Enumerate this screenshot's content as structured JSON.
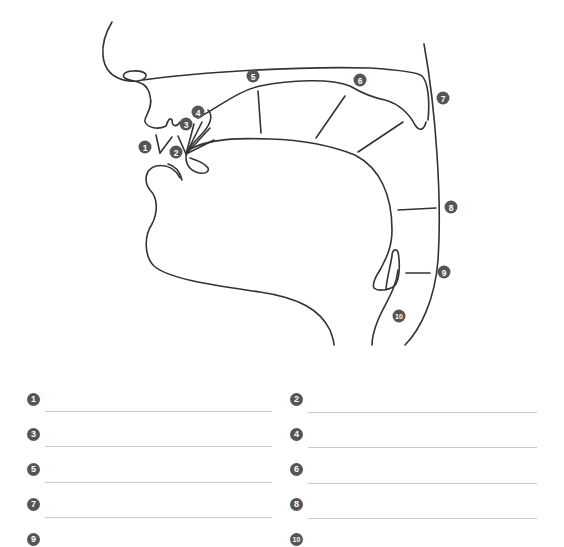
{
  "diagram": {
    "labels": [
      {
        "id": 1,
        "text": "1",
        "x": 145,
        "y": 147
      },
      {
        "id": 2,
        "text": "2",
        "x": 176,
        "y": 152
      },
      {
        "id": 3,
        "text": "3",
        "x": 186,
        "y": 124
      },
      {
        "id": 4,
        "text": "4",
        "x": 198,
        "y": 112
      },
      {
        "id": 5,
        "text": "5",
        "x": 253,
        "y": 76
      },
      {
        "id": 6,
        "text": "6",
        "x": 360,
        "y": 80
      },
      {
        "id": 7,
        "text": "7",
        "x": 443,
        "y": 98
      },
      {
        "id": 8,
        "text": "8",
        "x": 451,
        "y": 207
      },
      {
        "id": 9,
        "text": "9",
        "x": 444,
        "y": 272
      },
      {
        "id": 10,
        "text": "10",
        "x": 399,
        "y": 316
      }
    ]
  },
  "worksheet": {
    "items": [
      {
        "num": "1",
        "answer": ""
      },
      {
        "num": "2",
        "answer": ""
      },
      {
        "num": "3",
        "answer": ""
      },
      {
        "num": "4",
        "answer": ""
      },
      {
        "num": "5",
        "answer": ""
      },
      {
        "num": "6",
        "answer": ""
      },
      {
        "num": "7",
        "answer": ""
      },
      {
        "num": "8",
        "answer": ""
      },
      {
        "num": "9",
        "answer": ""
      },
      {
        "num": "10",
        "answer": ""
      }
    ]
  },
  "colors": {
    "stroke": "#333333",
    "badge": "#555555",
    "answer_line": "#c8c8c8"
  }
}
